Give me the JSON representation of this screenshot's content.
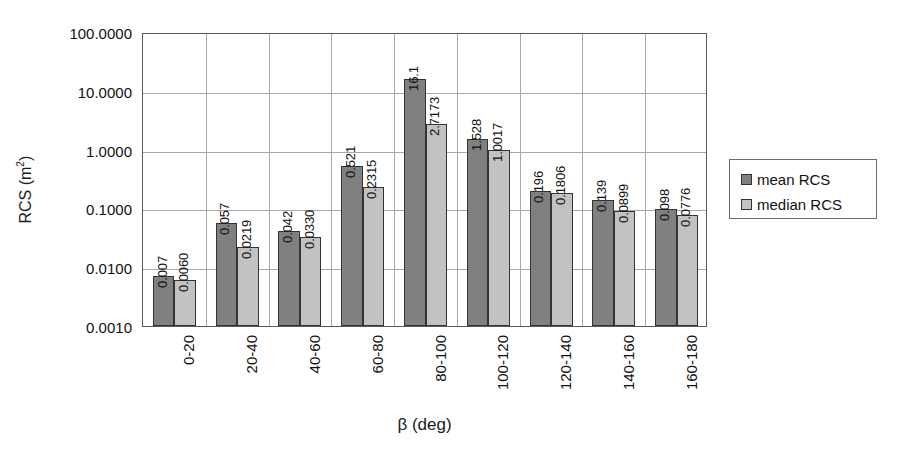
{
  "chart_data": {
    "type": "bar",
    "title": "",
    "xlabel": "β (deg)",
    "ylabel": "RCS (m²)",
    "ylabel_base": "RCS (m",
    "ylabel_sup": "2",
    "ylabel_tail": ")",
    "yscale": "log",
    "ylim": [
      0.001,
      100.0
    ],
    "grid": true,
    "legend_position": "right",
    "categories": [
      "0-20",
      "20-40",
      "40-60",
      "60-80",
      "80-100",
      "100-120",
      "120-140",
      "140-160",
      "160-180"
    ],
    "ytick_labels": [
      "100.0000",
      "10.0000",
      "1.0000",
      "0.1000",
      "0.0100",
      "0.0010"
    ],
    "ytick_values": [
      100.0,
      10.0,
      1.0,
      0.1,
      0.01,
      0.001
    ],
    "series": [
      {
        "name": "mean RCS",
        "color": "#808080",
        "values": [
          0.007,
          0.057,
          0.042,
          0.521,
          16.1,
          1.528,
          0.196,
          0.139,
          0.098
        ],
        "labels": [
          "0.007",
          "0.057",
          "0.042",
          "0.521",
          "16.1",
          "1.528",
          "0.196",
          "0.139",
          "0.098"
        ]
      },
      {
        "name": "median RCS",
        "color": "#c2c2c2",
        "values": [
          0.006,
          0.0219,
          0.033,
          0.2315,
          2.7173,
          1.0017,
          0.1806,
          0.0899,
          0.0776
        ],
        "labels": [
          "0.0060",
          "0.0219",
          "0.0330",
          "0.2315",
          "2.7173",
          "1.0017",
          "0.1806",
          "0.0899",
          "0.0776"
        ]
      }
    ]
  },
  "legend": {
    "items": [
      {
        "label": "mean RCS",
        "swatch": "mean"
      },
      {
        "label": "median RCS",
        "swatch": "median"
      }
    ]
  }
}
